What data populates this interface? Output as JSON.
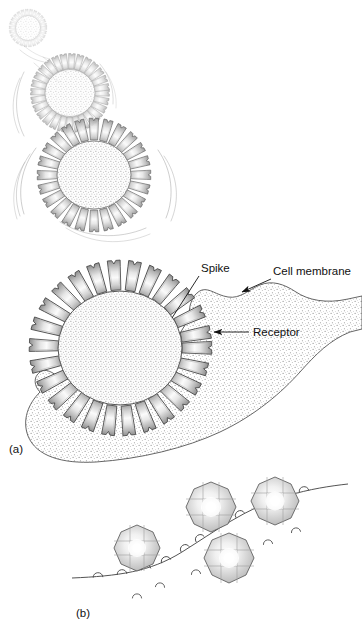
{
  "figure": {
    "background_color": "#ffffff",
    "ink_color": "#3a3a3a",
    "label_color": "#111111",
    "stipple_color": "#9a9a9a",
    "spike_fill_light": "#ffffff",
    "spike_fill_mid": "#d8d8d8",
    "spike_fill_dark": "#9e9e9e",
    "core_fill": "#efefef",
    "membrane_fill": "#ececec",
    "capsid_fill": "#dcdcdc"
  },
  "panels": [
    {
      "id": "panel-a",
      "label": "(a)",
      "label_x": 9,
      "label_y": 453,
      "description": "Enveloped virus particle with club-shaped spikes attaching to a stippled cell membrane"
    },
    {
      "id": "panel-b",
      "label": "(b)",
      "label_x": 76,
      "label_y": 617,
      "description": "Octagonal naked virions binding to receptors on a cell membrane"
    }
  ],
  "annotations": [
    {
      "id": "spike",
      "text": "Spike",
      "text_x": 201,
      "text_y": 272,
      "leader": {
        "x1": 199,
        "y1": 276,
        "x2": 172,
        "y2": 318
      },
      "has_arrowhead": false
    },
    {
      "id": "cell-membrane",
      "text": "Cell membrane",
      "text_x": 273,
      "text_y": 275,
      "leader": {
        "x1": 271,
        "y1": 279,
        "x2": 240,
        "y2": 293
      },
      "has_arrowhead": true
    },
    {
      "id": "receptor",
      "text": "Receptor",
      "text_x": 253,
      "text_y": 336,
      "leader": {
        "x1": 250,
        "y1": 332,
        "x2": 212,
        "y2": 332
      },
      "has_arrowhead": true
    }
  ],
  "virions_top": [
    {
      "id": "virion-small",
      "cx": 28,
      "cy": 28,
      "r": 13,
      "spikes": 26,
      "spike_len": 7,
      "opacity": 0.3
    },
    {
      "id": "virion-medium",
      "cx": 70,
      "cy": 93,
      "r": 26,
      "spikes": 28,
      "spike_len": 16,
      "opacity": 0.55
    },
    {
      "id": "virion-large",
      "cx": 94,
      "cy": 175,
      "r": 38,
      "spikes": 24,
      "spike_len": 22,
      "opacity": 0.85
    }
  ],
  "virion_main": {
    "id": "virion-attached",
    "cx": 120,
    "cy": 348,
    "rx": 68,
    "ry": 62,
    "spikes": 26,
    "spike_len": 30
  },
  "motion_arcs": [
    {
      "id": "arc-small-1",
      "cx": 34,
      "cy": 36,
      "r": 21,
      "a0": 200,
      "a1": 320
    },
    {
      "id": "arc-medium-1",
      "cx": 70,
      "cy": 93,
      "r": 52,
      "a0": 120,
      "a1": 235
    },
    {
      "id": "arc-medium-2",
      "cx": 70,
      "cy": 93,
      "r": 57,
      "a0": 130,
      "a1": 225
    },
    {
      "id": "arc-large-1",
      "cx": 94,
      "cy": 175,
      "r": 70,
      "a0": 120,
      "a1": 250
    },
    {
      "id": "arc-large-2",
      "cx": 94,
      "cy": 175,
      "r": 76,
      "a0": 130,
      "a1": 245
    },
    {
      "id": "arc-large-3",
      "cx": 94,
      "cy": 175,
      "r": 82,
      "a0": 140,
      "a1": 238
    }
  ],
  "capsids_b": [
    {
      "id": "capsid-left",
      "cx": 137,
      "cy": 548,
      "r": 23
    },
    {
      "id": "capsid-upper",
      "cx": 211,
      "cy": 507,
      "r": 25
    },
    {
      "id": "capsid-right",
      "cx": 275,
      "cy": 501,
      "r": 24
    },
    {
      "id": "capsid-lower",
      "cx": 229,
      "cy": 558,
      "r": 25
    }
  ],
  "membrane_b": {
    "id": "membrane-curve-b",
    "path_points": "M 72,578 C 118,576 150,572 182,552 C 214,532 246,508 286,496 C 310,489 330,486 348,484",
    "receptor_count_on_line": 11,
    "free_receptor_count": 7
  }
}
